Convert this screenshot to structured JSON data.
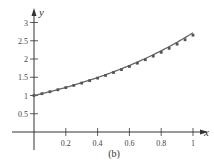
{
  "chart_data": {
    "type": "line",
    "title": "",
    "caption": "(b)",
    "xlabel": "x",
    "ylabel": "y",
    "xlim": [
      0,
      1.08
    ],
    "ylim": [
      0,
      3.2
    ],
    "grid": false,
    "x_ticks": [
      0.2,
      0.4,
      0.6,
      0.8,
      1
    ],
    "x_tick_labels": [
      "0.2",
      "0.4",
      "0.6",
      "0.8",
      "1"
    ],
    "y_ticks": [
      0.5,
      1,
      1.5,
      2,
      2.5,
      3
    ],
    "y_tick_labels": [
      "0.5",
      "1",
      "1.5",
      "2",
      "2.5",
      "3"
    ],
    "series": [
      {
        "name": "exact solution y = e^x",
        "style": "solid line",
        "x": [
          0,
          0.1,
          0.2,
          0.3,
          0.4,
          0.5,
          0.6,
          0.7,
          0.8,
          0.9,
          1.0
        ],
        "values": [
          1.0,
          1.105,
          1.221,
          1.35,
          1.492,
          1.649,
          1.822,
          2.014,
          2.226,
          2.46,
          2.718
        ]
      },
      {
        "name": "approximation points (step 0.05)",
        "style": "square markers",
        "x": [
          0,
          0.05,
          0.1,
          0.15,
          0.2,
          0.25,
          0.3,
          0.35,
          0.4,
          0.45,
          0.5,
          0.55,
          0.6,
          0.65,
          0.7,
          0.75,
          0.8,
          0.85,
          0.9,
          0.95,
          1.0
        ],
        "values": [
          1.0,
          1.05,
          1.103,
          1.158,
          1.216,
          1.276,
          1.34,
          1.407,
          1.477,
          1.551,
          1.629,
          1.71,
          1.796,
          1.886,
          1.98,
          2.079,
          2.183,
          2.292,
          2.407,
          2.527,
          2.653
        ]
      }
    ]
  },
  "colors": {
    "axis": "#333333",
    "curve": "#666666",
    "marker": "#555555"
  }
}
